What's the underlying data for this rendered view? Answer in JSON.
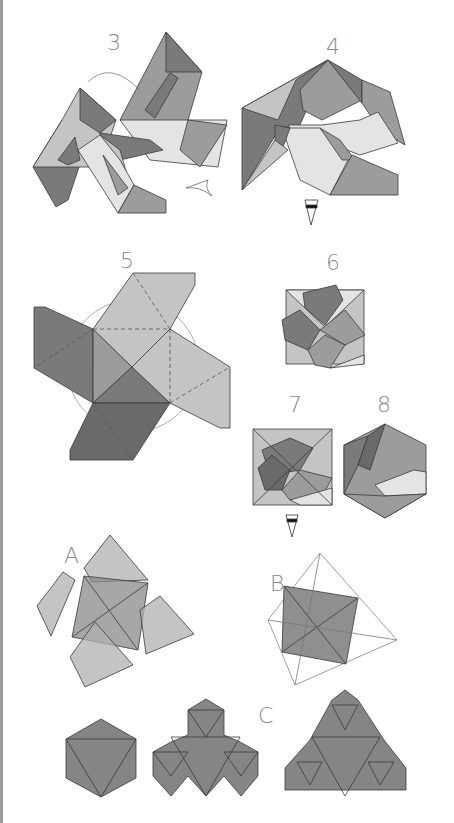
{
  "page": {
    "type": "origami diagram page",
    "step_labels": [
      "3",
      "4",
      "5",
      "6",
      "7",
      "8"
    ],
    "variant_labels": [
      "A",
      "B",
      "C"
    ]
  },
  "steps": {
    "s3": {
      "label": "3"
    },
    "s4": {
      "label": "4"
    },
    "s5": {
      "label": "5"
    },
    "s6": {
      "label": "6"
    },
    "s7": {
      "label": "7"
    },
    "s8": {
      "label": "8"
    }
  },
  "variants": {
    "a": {
      "label": "A"
    },
    "b": {
      "label": "B"
    },
    "c": {
      "label": "C"
    }
  },
  "colors": {
    "dark": "#7a7a7a",
    "mid": "#9c9c9c",
    "light": "#c4c4c4",
    "pale": "#e4e4e4",
    "line": "#3a3a3a",
    "label": "#8a8a8a",
    "border": "#9a9a9a"
  }
}
